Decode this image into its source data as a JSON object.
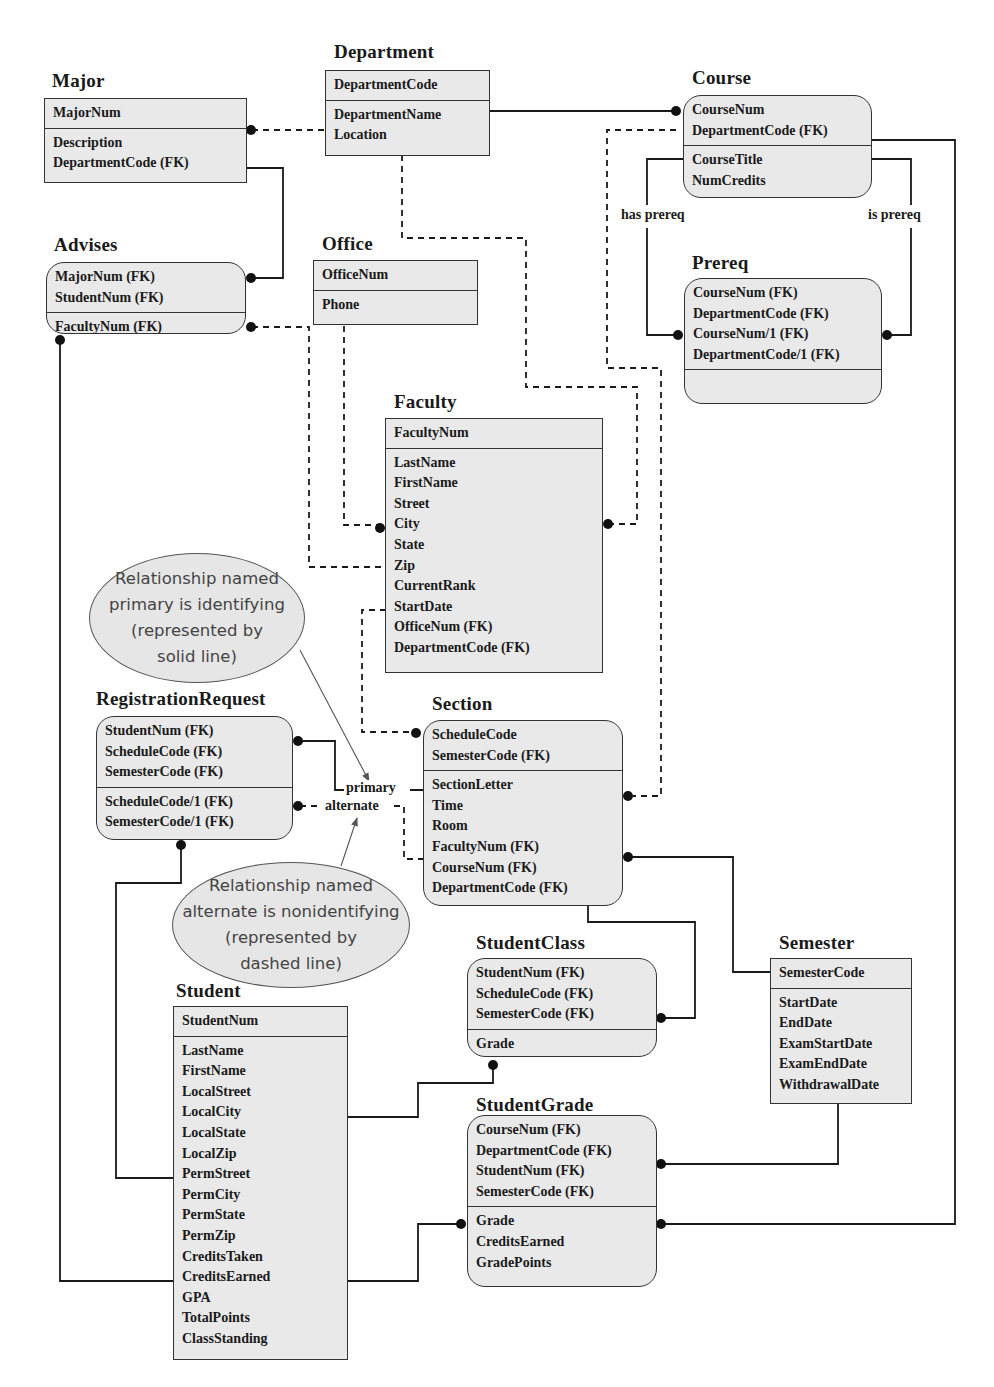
{
  "entities": {
    "major": {
      "title": "Major",
      "key": [
        "MajorNum"
      ],
      "attrs": [
        "Description",
        "DepartmentCode (FK)"
      ]
    },
    "department": {
      "title": "Department",
      "key": [
        "DepartmentCode"
      ],
      "attrs": [
        "DepartmentName",
        "Location"
      ]
    },
    "course": {
      "title": "Course",
      "key": [
        "CourseNum",
        "DepartmentCode (FK)"
      ],
      "attrs": [
        "CourseTitle",
        "NumCredits"
      ]
    },
    "advises": {
      "title": "Advises",
      "key": [
        "MajorNum (FK)",
        "StudentNum (FK)"
      ],
      "attrs": [
        "FacultyNum (FK)"
      ]
    },
    "office": {
      "title": "Office",
      "key": [
        "OfficeNum"
      ],
      "attrs": [
        "Phone"
      ]
    },
    "prereq": {
      "title": "Prereq",
      "key": [
        "CourseNum (FK)",
        "DepartmentCode (FK)",
        "CourseNum/1 (FK)",
        "DepartmentCode/1 (FK)"
      ],
      "attrs": []
    },
    "faculty": {
      "title": "Faculty",
      "key": [
        "FacultyNum"
      ],
      "attrs": [
        "LastName",
        "FirstName",
        "Street",
        "City",
        "State",
        "Zip",
        "CurrentRank",
        "StartDate",
        "OfficeNum (FK)",
        "DepartmentCode (FK)"
      ]
    },
    "registration_request": {
      "title": "RegistrationRequest",
      "key": [
        "StudentNum (FK)",
        "ScheduleCode (FK)",
        "SemesterCode (FK)"
      ],
      "attrs": [
        "ScheduleCode/1 (FK)",
        "SemesterCode/1 (FK)"
      ]
    },
    "section": {
      "title": "Section",
      "key": [
        "ScheduleCode",
        "SemesterCode (FK)"
      ],
      "attrs": [
        "SectionLetter",
        "Time",
        "Room",
        "FacultyNum (FK)",
        "CourseNum (FK)",
        "DepartmentCode (FK)"
      ]
    },
    "student_class": {
      "title": "StudentClass",
      "key": [
        "StudentNum (FK)",
        "ScheduleCode (FK)",
        "SemesterCode (FK)"
      ],
      "attrs": [
        "Grade"
      ]
    },
    "semester": {
      "title": "Semester",
      "key": [
        "SemesterCode"
      ],
      "attrs": [
        "StartDate",
        "EndDate",
        "ExamStartDate",
        "ExamEndDate",
        "WithdrawalDate"
      ]
    },
    "student": {
      "title": "Student",
      "key": [
        "StudentNum"
      ],
      "attrs": [
        "LastName",
        "FirstName",
        "LocalStreet",
        "LocalCity",
        "LocalState",
        "LocalZip",
        "PermStreet",
        "PermCity",
        "PermState",
        "PermZip",
        "CreditsTaken",
        "CreditsEarned",
        "GPA",
        "TotalPoints",
        "ClassStanding"
      ]
    },
    "student_grade": {
      "title": "StudentGrade",
      "key": [
        "CourseNum (FK)",
        "DepartmentCode (FK)",
        "StudentNum (FK)",
        "SemesterCode (FK)"
      ],
      "attrs": [
        "Grade",
        "CreditsEarned",
        "GradePoints"
      ]
    }
  },
  "relationships": {
    "has_prereq": "has  prereq",
    "is_prereq": "is  prereq",
    "primary": "primary",
    "alternate": "alternate"
  },
  "notes": {
    "identifying": [
      "Relationship named",
      "primary is identifying",
      "(represented by",
      "solid line)"
    ],
    "nonidentifying": [
      "Relationship named",
      "alternate is nonidentifying",
      "(represented by",
      "dashed line)"
    ]
  },
  "colors": {
    "entity_fill": "#e9e9e9",
    "line": "#1a1a1a",
    "note_fill": "#e6e6e6"
  }
}
